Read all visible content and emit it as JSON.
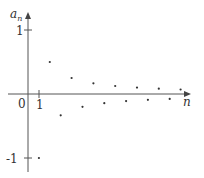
{
  "chart_data": {
    "type": "scatter",
    "title": "",
    "xlabel": "n",
    "ylabel": "a_n",
    "ylabel_main": "a",
    "ylabel_sub": "n",
    "formula": "a_n = (-1)^n / n",
    "x_ticks": [
      "1"
    ],
    "y_ticks": [
      "1",
      "-1"
    ],
    "origin_label": "0",
    "grid": false,
    "legend": null,
    "xlim": [
      0,
      14.5
    ],
    "ylim": [
      -1.2,
      1.3
    ],
    "x": [
      1,
      2,
      3,
      4,
      5,
      6,
      7,
      8,
      9,
      10,
      11,
      12,
      13,
      14
    ],
    "values": [
      -1,
      0.5,
      -0.333,
      0.25,
      -0.2,
      0.167,
      -0.143,
      0.125,
      -0.111,
      0.1,
      -0.091,
      0.083,
      -0.077,
      0.071
    ],
    "colors": {
      "axis": "#555555",
      "points": "#333333"
    }
  }
}
